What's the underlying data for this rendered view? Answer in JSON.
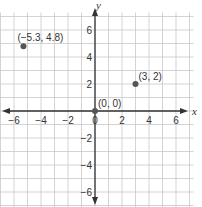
{
  "chart_data": {
    "type": "scatter",
    "title": "",
    "xlabel": "x",
    "ylabel": "y",
    "xlim": [
      -7,
      7
    ],
    "ylim": [
      -7,
      7
    ],
    "grid": true,
    "x_ticks": [
      -6,
      -4,
      -2,
      0,
      2,
      4,
      6
    ],
    "y_ticks": [
      6,
      4,
      2,
      -2,
      -4,
      -6
    ],
    "points": [
      {
        "x": -5.3,
        "y": 4.8,
        "label": "(−5.3, 4.8)"
      },
      {
        "x": 3,
        "y": 2,
        "label": "(3, 2)"
      },
      {
        "x": 0,
        "y": 0,
        "label": "(0, 0)"
      }
    ],
    "colors": {
      "grid": "#c8c8c8",
      "axis": "#333333",
      "point": "#555555"
    }
  }
}
